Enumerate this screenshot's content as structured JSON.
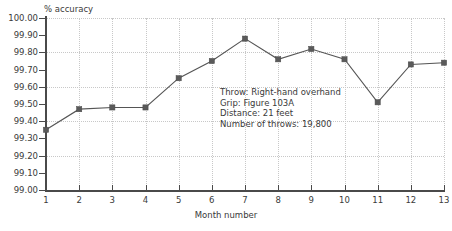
{
  "chart_data": {
    "type": "line",
    "title": "",
    "xlabel": "Month number",
    "ylabel": "% accuracy",
    "categories": [
      1,
      2,
      3,
      4,
      5,
      6,
      7,
      8,
      9,
      10,
      11,
      12,
      13
    ],
    "values": [
      99.35,
      99.47,
      99.48,
      99.48,
      99.65,
      99.75,
      99.88,
      99.76,
      99.82,
      99.76,
      99.51,
      99.73,
      99.74
    ],
    "x_tick_labels": [
      "1",
      "2",
      "3",
      "4",
      "5",
      "6",
      "7",
      "8",
      "9",
      "10",
      "11",
      "12",
      "13"
    ],
    "y_tick_labels": [
      "100.00",
      "99.90",
      "99.80",
      "99.70",
      "99.60",
      "99.50",
      "99.40",
      "99.30",
      "99.20",
      "99.10",
      "99.00"
    ],
    "y_tick_values": [
      100.0,
      99.9,
      99.8,
      99.7,
      99.6,
      99.5,
      99.4,
      99.3,
      99.2,
      99.1,
      99.0
    ],
    "xlim": [
      1,
      13
    ],
    "ylim": [
      99.0,
      100.0
    ],
    "grid": true,
    "grid_style": "dotted",
    "legend": "none",
    "marker": "square",
    "series_color": "#555555",
    "grid_color": "#c8c8c8",
    "axis_color": "#4a4a4a",
    "annotations": [
      "Throw: Right-hand overhand",
      "Grip: Figure 103A",
      "Distance: 21 feet",
      "Number of throws: 19,800"
    ]
  },
  "annotation_box": {
    "line1": "Throw: Right-hand overhand",
    "line2": "Grip: Figure 103A",
    "line3": "Distance: 21 feet",
    "line4": "Number of throws: 19,800"
  },
  "axes": {
    "y_title": "% accuracy",
    "x_title": "Month number"
  }
}
